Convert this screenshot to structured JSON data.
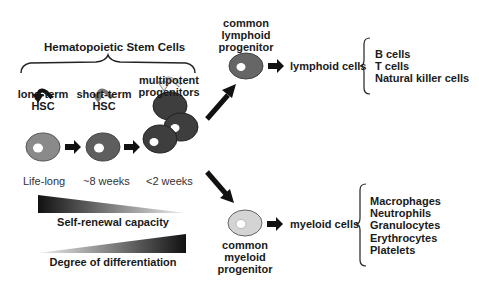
{
  "title": "Hematopoietic Stem Cells",
  "stages": [
    {
      "label_line1": "long-term",
      "label_line2": "HSC",
      "duration": "Life-long",
      "fill": "#8a8a8a"
    },
    {
      "label_line1": "short-term",
      "label_line2": "HSC",
      "duration": "~8 weeks",
      "fill": "#5e5e5e"
    },
    {
      "label_line1": "multipotent",
      "label_line2": "progenitors",
      "duration": "<2 weeks",
      "fill": "#3e3e3e"
    }
  ],
  "gradients": {
    "self_renewal": "Self-renewal capacity",
    "differentiation": "Degree of differentiation"
  },
  "lymphoid": {
    "progenitor_line1": "common",
    "progenitor_line2": "lymphoid",
    "progenitor_line3": "progenitor",
    "cells_label": "lymphoid cells",
    "types": [
      "B cells",
      "T cells",
      "Natural killer cells"
    ],
    "fill": "#666666"
  },
  "myeloid": {
    "progenitor_line1": "common",
    "progenitor_line2": "myeloid",
    "progenitor_line3": "progenitor",
    "cells_label": "myeloid cells",
    "types": [
      "Macrophages",
      "Neutrophils",
      "Granulocytes",
      "Erythrocytes",
      "Platelets"
    ],
    "fill": "#d4d4d4"
  }
}
